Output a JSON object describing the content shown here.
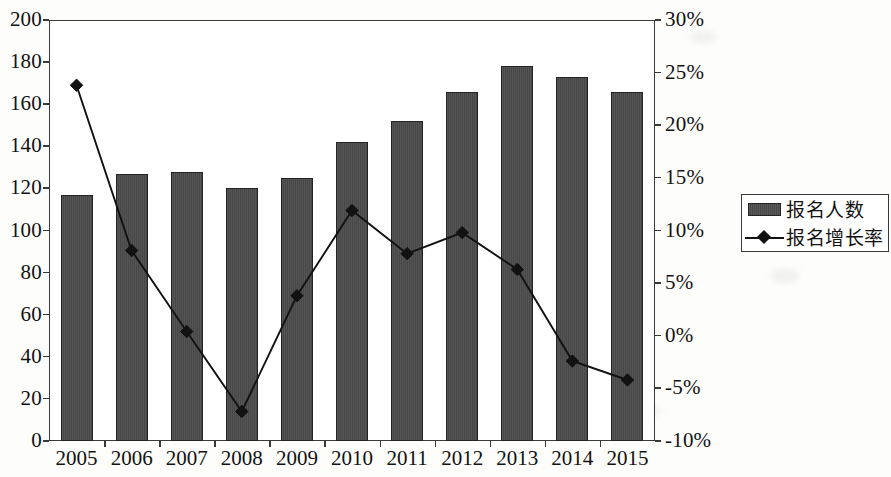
{
  "chart_data": {
    "type": "bar",
    "title": "",
    "subtitle": "",
    "xlabel": "",
    "ylabel": "",
    "categories": [
      "2005",
      "2006",
      "2007",
      "2008",
      "2009",
      "2010",
      "2011",
      "2012",
      "2013",
      "2014",
      "2015"
    ],
    "series": [
      {
        "name": "报名人数",
        "type": "bar",
        "axis": "left",
        "values": [
          117,
          127,
          128,
          120,
          125,
          142,
          152,
          166,
          178,
          173,
          166
        ]
      },
      {
        "name": "报名增长率",
        "type": "line",
        "axis": "right",
        "marker": "diamond",
        "values": [
          23.8,
          8.1,
          0.4,
          -7.2,
          3.8,
          11.9,
          7.8,
          9.8,
          6.3,
          -2.4,
          -4.2
        ]
      }
    ],
    "left_axis": {
      "ticks": [
        "0",
        "20",
        "40",
        "60",
        "80",
        "100",
        "120",
        "140",
        "160",
        "180",
        "200"
      ],
      "min": 0,
      "max": 200,
      "step": 20
    },
    "right_axis": {
      "ticks": [
        "-10%",
        "-5%",
        "0%",
        "5%",
        "10%",
        "15%",
        "20%",
        "25%",
        "30%"
      ],
      "min": -10,
      "max": 30,
      "step": 5
    },
    "grid": false,
    "legend": {
      "position": "right",
      "entries": [
        {
          "label": "报名人数",
          "marker": "bar-swatch",
          "color": "#4b4b4b"
        },
        {
          "label": "报名增长率",
          "marker": "line-diamond",
          "color": "#121212"
        }
      ]
    },
    "colors": {
      "bar_fill": "#4b4b4b",
      "bar_border": "#242424",
      "line": "#121212",
      "axis": "#3a3a3a",
      "background": "#ffffff"
    }
  }
}
